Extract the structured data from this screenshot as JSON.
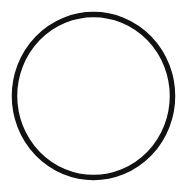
{
  "shape": {
    "type": "circle-outline",
    "stroke_color": "#111111",
    "fill_color": "#ffffff",
    "background": "#ffffff",
    "cx": 93.5,
    "cy": 96,
    "rx": 79,
    "ry": 81.5,
    "stroke_width": 5.5
  }
}
